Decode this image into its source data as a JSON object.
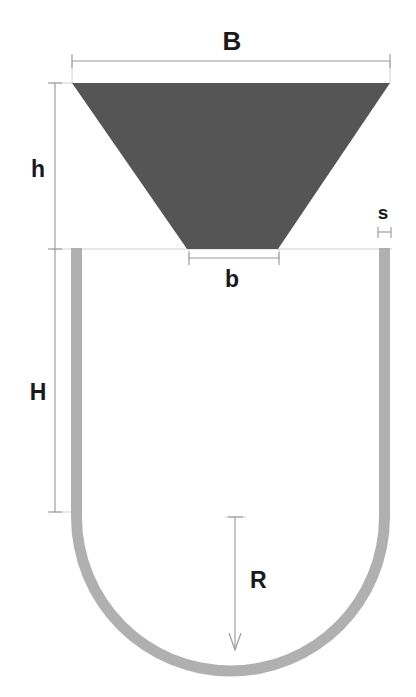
{
  "figure": {
    "type": "engineering-cross-section",
    "background_color": "#ffffff"
  },
  "shapes": {
    "hopper": {
      "name": "hopper-trapezoid",
      "fill_color": "#555555",
      "top_width_label": "B",
      "bottom_width_label": "b",
      "height_label": "h",
      "top_left_x": 72,
      "top_right_x": 390,
      "top_y": 83,
      "bottom_left_x": 187,
      "bottom_right_x": 278,
      "bottom_y": 249
    },
    "trough": {
      "name": "u-trough",
      "stroke_color": "#b0b0b0",
      "wall_thickness_label": "s",
      "straight_height_label": "H",
      "radius_label": "R",
      "left_wall_outer_x": 71,
      "left_wall_inner_x": 82,
      "right_wall_inner_x": 379,
      "right_wall_outer_x": 390,
      "top_y": 248,
      "arc_center_x": 230.5,
      "arc_center_y": 517,
      "outer_radius": 159.5,
      "inner_radius": 148.5
    }
  },
  "dimensions": [
    {
      "id": "B",
      "label": "B",
      "meaning": "Hopper top width",
      "orientation": "horizontal",
      "line_y": 61,
      "x_start": 72,
      "x_end": 390,
      "label_x": 232,
      "label_y": 50
    },
    {
      "id": "h",
      "label": "h",
      "meaning": "Hopper vertical height",
      "orientation": "vertical",
      "line_x": 55,
      "y_start": 83,
      "y_end": 249,
      "label_x": 38,
      "label_y": 177
    },
    {
      "id": "b",
      "label": "b",
      "meaning": "Hopper bottom opening width",
      "orientation": "horizontal",
      "line_y": 258,
      "x_start": 189,
      "x_end": 279,
      "label_x": 232,
      "label_y": 287
    },
    {
      "id": "s",
      "label": "s",
      "meaning": "Trough wall thickness",
      "orientation": "horizontal",
      "line_y": 232,
      "x_start": 378,
      "x_end": 390,
      "label_x": 383,
      "label_y": 219
    },
    {
      "id": "H",
      "label": "H",
      "meaning": "Trough straight side wall height",
      "orientation": "vertical",
      "line_x": 55,
      "y_start": 249,
      "y_end": 512,
      "label_x": 38,
      "label_y": 400
    },
    {
      "id": "R",
      "label": "R",
      "meaning": "Trough bottom radius",
      "orientation": "vertical-arrow",
      "line_x": 235,
      "y_start": 517,
      "y_end": 647,
      "label_x": 250,
      "label_y": 588
    }
  ],
  "labels": {
    "B": "B",
    "h": "h",
    "b": "b",
    "s": "s",
    "H": "H",
    "R": "R"
  },
  "colors": {
    "hopper_fill": "#555555",
    "trough_wall": "#b0b0b0",
    "dimension_line": "#9a9a9a",
    "extension_line": "#d2d2d2",
    "text": "#1a1a1a",
    "background": "#ffffff"
  }
}
